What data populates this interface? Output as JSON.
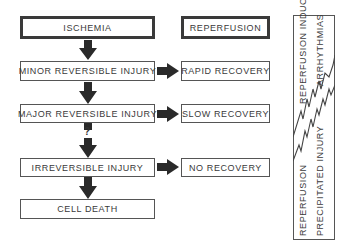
{
  "diagram": {
    "left_column": {
      "ischemia": "ISCHEMIA",
      "minor": "MINOR REVERSIBLE INJURY",
      "major": "MAJOR REVERSIBLE INJURY",
      "question": "?",
      "irreversible": "IRREVERSIBLE INJURY",
      "cell_death": "CELL DEATH"
    },
    "middle_column": {
      "reperfusion": "REPERFUSION",
      "rapid": "RAPID RECOVERY",
      "slow": "SLOW RECOVERY",
      "none": "NO RECOVERY"
    },
    "right_panel": {
      "upper_line1": "REPERFUSION INDUCED",
      "upper_line2": "ARRHYTHMIAS",
      "lower_line1": "REPERFUSION",
      "lower_line2": "PRECIPITATED INJURY"
    },
    "colors": {
      "arrow": "#2a2a2a",
      "border": "#555555",
      "text": "#3a3a3a"
    }
  }
}
